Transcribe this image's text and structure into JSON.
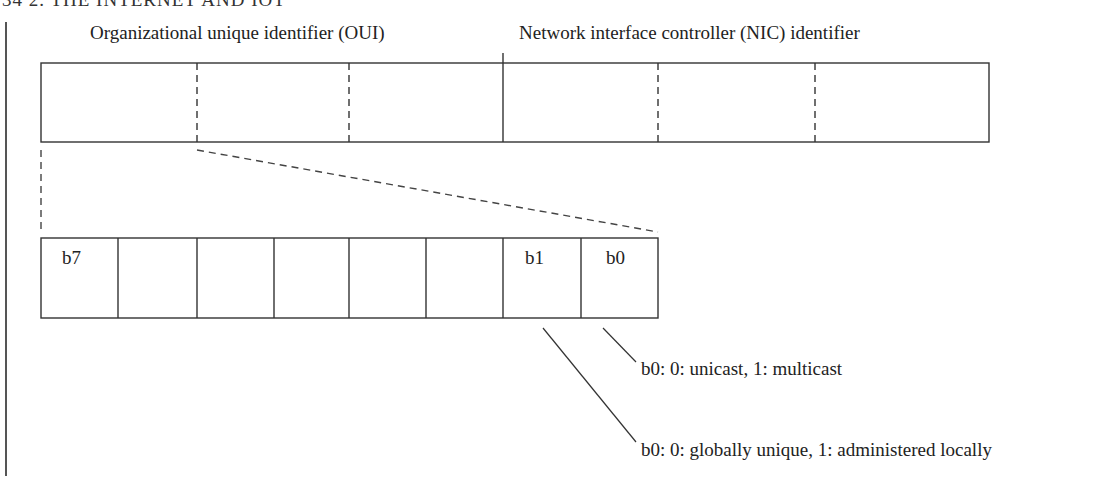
{
  "page": {
    "header": "34    2. THE INTERNET AND IOT"
  },
  "diagram": {
    "oui_label": "Organizational unique identifier (OUI)",
    "nic_label": "Network interface controller (NIC) identifier",
    "octets_count": 6,
    "bit_cells": [
      "b7",
      "",
      "",
      "",
      "",
      "",
      "b1",
      "b0"
    ],
    "annotations": [
      "b0: 0: unicast, 1: multicast",
      "b0: 0: globally unique, 1: administered locally"
    ],
    "line_color": "#333333"
  }
}
